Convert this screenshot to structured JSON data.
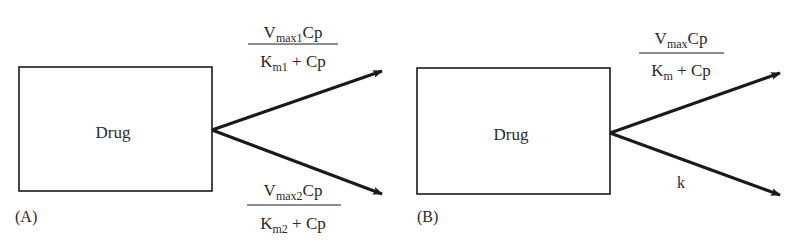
{
  "panels": [
    {
      "label": "(A)",
      "compartment": "Drug",
      "upper_rate": {
        "num_main": "V",
        "num_sub": "max1",
        "num_tail": "Cp",
        "den_main": "K",
        "den_sub": "m1",
        "den_tail": " + Cp"
      },
      "lower_rate": {
        "num_main": "V",
        "num_sub": "max2",
        "num_tail": "Cp",
        "den_main": "K",
        "den_sub": "m2",
        "den_tail": " + Cp"
      }
    },
    {
      "label": "(B)",
      "compartment": "Drug",
      "upper_rate": {
        "num_main": "V",
        "num_sub": "max",
        "num_tail": "Cp",
        "den_main": "K",
        "den_sub": "m",
        "den_tail": " + Cp"
      },
      "lower_rate": {
        "constant": "k"
      }
    }
  ],
  "colors": {
    "stroke": "#1a1a1a",
    "text": "#2a2a2a",
    "background": "#ffffff"
  }
}
